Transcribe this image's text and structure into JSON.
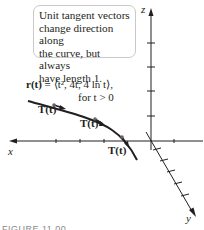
{
  "callout": {
    "lines": [
      "Unit tangent vectors",
      "change direction along",
      "the curve, but always",
      "have length 1."
    ]
  },
  "equation": {
    "lhs": "r(t) = ",
    "rhs": "⟨t², 4t, 4 ln t⟩,",
    "condition": "for t > 0"
  },
  "vector_labels": [
    "T(t)",
    "T(t)",
    "T(t)"
  ],
  "axes": {
    "x": "x",
    "y": "y",
    "z": "z"
  },
  "caption": "FIGURE 11.00",
  "colors": {
    "ink": "#231f20",
    "border": "#c9c9c9",
    "caption": "#8a8a8a"
  }
}
